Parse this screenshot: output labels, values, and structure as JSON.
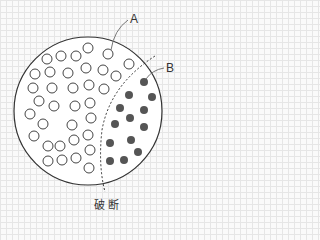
{
  "labels": {
    "a": "A",
    "b": "B",
    "caption": "破断"
  },
  "colors": {
    "outline": "#333333",
    "open_fill": "#ffffff",
    "dot_fill": "#555555",
    "background": "#fafafa"
  },
  "diagram": {
    "outer_circle": {
      "cx": 88,
      "cy": 111,
      "r": 74
    },
    "open_circles": [
      [
        88,
        48
      ],
      [
        47,
        59
      ],
      [
        61,
        56
      ],
      [
        76,
        56
      ],
      [
        108,
        54
      ],
      [
        129,
        64
      ],
      [
        35,
        74
      ],
      [
        50,
        72
      ],
      [
        68,
        73
      ],
      [
        86,
        68
      ],
      [
        103,
        70
      ],
      [
        116,
        76
      ],
      [
        33,
        88
      ],
      [
        52,
        88
      ],
      [
        73,
        88
      ],
      [
        89,
        85
      ],
      [
        104,
        89
      ],
      [
        39,
        101
      ],
      [
        54,
        106
      ],
      [
        75,
        106
      ],
      [
        90,
        103
      ],
      [
        30,
        114
      ],
      [
        43,
        124
      ],
      [
        72,
        125
      ],
      [
        91,
        118
      ],
      [
        34,
        136
      ],
      [
        48,
        146
      ],
      [
        60,
        146
      ],
      [
        74,
        140
      ],
      [
        88,
        135
      ],
      [
        48,
        161
      ],
      [
        62,
        160
      ],
      [
        76,
        158
      ],
      [
        90,
        150
      ],
      [
        89,
        168
      ]
    ],
    "filled_dots": [
      [
        144,
        82
      ],
      [
        152,
        97
      ],
      [
        129,
        95
      ],
      [
        120,
        108
      ],
      [
        144,
        110
      ],
      [
        115,
        124
      ],
      [
        130,
        118
      ],
      [
        144,
        127
      ],
      [
        110,
        143
      ],
      [
        131,
        140
      ],
      [
        138,
        152
      ],
      [
        110,
        161
      ],
      [
        124,
        160
      ]
    ]
  }
}
